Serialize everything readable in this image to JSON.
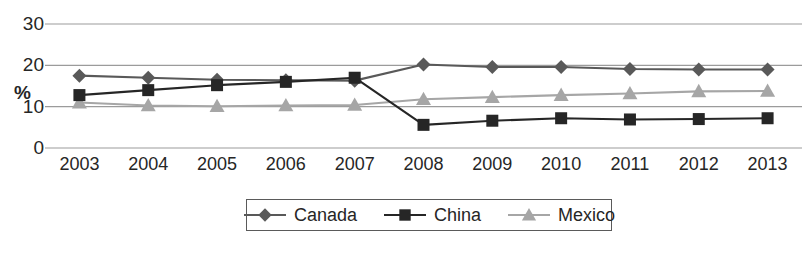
{
  "chart_data": {
    "type": "line",
    "title": "",
    "xlabel": "",
    "ylabel": "%",
    "categories": [
      "2003",
      "2004",
      "2005",
      "2006",
      "2007",
      "2008",
      "2009",
      "2010",
      "2011",
      "2012",
      "2013"
    ],
    "ylim": [
      0,
      30
    ],
    "yticks": [
      0,
      10,
      20,
      30
    ],
    "grid": true,
    "legend_position": "bottom",
    "series": [
      {
        "name": "Canada",
        "marker": "diamond",
        "color": "#595959",
        "values": [
          17.5,
          17.0,
          16.5,
          16.4,
          16.3,
          20.2,
          19.6,
          19.6,
          19.1,
          19.0,
          19.0
        ]
      },
      {
        "name": "China",
        "marker": "square",
        "color": "#262626",
        "values": [
          12.8,
          14.0,
          15.2,
          16.0,
          17.0,
          5.6,
          6.6,
          7.2,
          6.9,
          7.0,
          7.2
        ]
      },
      {
        "name": "Mexico",
        "marker": "triangle",
        "color": "#a6a6a6",
        "values": [
          11.0,
          10.3,
          10.1,
          10.3,
          10.4,
          11.8,
          12.3,
          12.8,
          13.2,
          13.7,
          13.8
        ]
      }
    ]
  },
  "axis": {
    "y_label": "%",
    "y_tick_labels": [
      "30",
      "20",
      "10",
      "0"
    ]
  },
  "legend": {
    "entries": [
      {
        "label": "Canada"
      },
      {
        "label": "China"
      },
      {
        "label": "Mexico"
      }
    ]
  },
  "colors": {
    "canada": "#595959",
    "china": "#262626",
    "mexico": "#a6a6a6",
    "gridline": "#9b9b9b",
    "text": "#262626",
    "legend_border": "#5a5a5a"
  }
}
